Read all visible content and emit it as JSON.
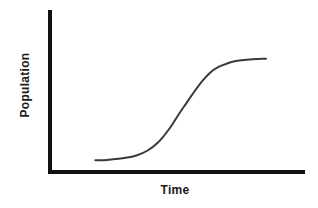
{
  "chart_data": {
    "type": "line",
    "title": "",
    "subtitle": "",
    "xlabel": "Time",
    "ylabel": "Population",
    "grid": false,
    "legend": null,
    "axis_ticks": {
      "x": [],
      "y": []
    },
    "xlim": [
      0,
      1
    ],
    "ylim": [
      0,
      1
    ],
    "annotations": [],
    "series": [
      {
        "name": "Logistic population growth",
        "shape": "sigmoid",
        "x": [
          0.21,
          0.25,
          0.3,
          0.35,
          0.4,
          0.45,
          0.5,
          0.55,
          0.6,
          0.63,
          0.66,
          0.7,
          0.74,
          0.78,
          0.82,
          0.86,
          0.9,
          0.94,
          0.98,
          1.0
        ],
        "y": [
          0.1,
          0.1,
          0.11,
          0.12,
          0.14,
          0.18,
          0.25,
          0.36,
          0.5,
          0.58,
          0.66,
          0.76,
          0.84,
          0.89,
          0.92,
          0.94,
          0.95,
          0.955,
          0.96,
          0.96
        ],
        "color": "#3a3a3a",
        "line_width": 2
      }
    ],
    "axes_style": {
      "color": "#111111",
      "line_width": 4,
      "spines": [
        "left",
        "bottom"
      ]
    }
  },
  "figure": {
    "background_color": "#ffffff",
    "width": 318,
    "height": 208
  }
}
